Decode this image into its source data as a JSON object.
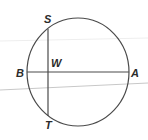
{
  "diagram": {
    "type": "geometry-circle-intersecting-chords",
    "colors": {
      "stroke": "#4a4a4a",
      "label": "#2b2b2b",
      "artifact_line": "#c8c8c8",
      "background": "#ffffff"
    },
    "circle": {
      "cx": 78,
      "cy": 72,
      "rx": 51,
      "ry": 54
    },
    "chords": [
      {
        "name": "BA",
        "from": "B",
        "to": "A",
        "x1": 27,
        "y1": 72,
        "x2": 129,
        "y2": 72
      },
      {
        "name": "ST",
        "from": "S",
        "to": "T",
        "x1": 48,
        "y1": 29,
        "x2": 48,
        "y2": 116
      }
    ],
    "intersection": {
      "label": "W",
      "x": 48,
      "y": 72
    },
    "labels": {
      "S": "S",
      "T": "T",
      "B": "B",
      "A": "A",
      "W": "W"
    },
    "artifact_lines": [
      {
        "x1": 0,
        "y1": 90,
        "x2": 148,
        "y2": 83
      },
      {
        "x1": 0,
        "y1": 41,
        "x2": 148,
        "y2": 38
      }
    ]
  }
}
